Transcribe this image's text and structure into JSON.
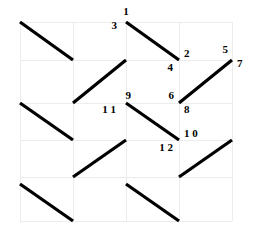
{
  "figure": {
    "title": "",
    "background_color": "#ffffff",
    "line_color": "#000000",
    "grid_color": "#ececec",
    "label_color": "#000000",
    "width": 254,
    "height": 237
  },
  "chart_data": {
    "type": "scatter",
    "title": "",
    "xlabel": "",
    "ylabel": "",
    "grid": true,
    "legend": "none",
    "xlim": [
      0,
      4
    ],
    "ylim": [
      0,
      5
    ],
    "grid_columns": 4,
    "grid_rows": 5,
    "grid_x_ticks": [
      20,
      73,
      126,
      179,
      232
    ],
    "grid_y_ticks": [
      22,
      60,
      103,
      140,
      177,
      221
    ],
    "segments": [
      {
        "id": "s1",
        "x1": 20,
        "y1": 22,
        "x2": 73,
        "y2": 60,
        "labels": []
      },
      {
        "id": "s2",
        "x1": 126,
        "y1": 22,
        "x2": 179,
        "y2": 60,
        "labels": [
          "1",
          "3",
          "2",
          "4"
        ]
      },
      {
        "id": "s3",
        "x1": 73,
        "y1": 103,
        "x2": 126,
        "y2": 60,
        "labels": []
      },
      {
        "id": "s4",
        "x1": 179,
        "y1": 103,
        "x2": 232,
        "y2": 60,
        "labels": [
          "5",
          "7",
          "6",
          "8"
        ]
      },
      {
        "id": "s5",
        "x1": 20,
        "y1": 103,
        "x2": 73,
        "y2": 140,
        "labels": []
      },
      {
        "id": "s6",
        "x1": 126,
        "y1": 103,
        "x2": 179,
        "y2": 140,
        "labels": [
          "9",
          "1 1",
          "1 0",
          "1 2"
        ]
      },
      {
        "id": "s7",
        "x1": 73,
        "y1": 177,
        "x2": 126,
        "y2": 140,
        "labels": []
      },
      {
        "id": "s8",
        "x1": 179,
        "y1": 177,
        "x2": 232,
        "y2": 140,
        "labels": []
      },
      {
        "id": "s9",
        "x1": 20,
        "y1": 184,
        "x2": 73,
        "y2": 221,
        "labels": []
      },
      {
        "id": "s10",
        "x1": 126,
        "y1": 184,
        "x2": 179,
        "y2": 221,
        "labels": []
      }
    ],
    "point_labels": [
      {
        "text": "1",
        "x": 126,
        "y": 6,
        "anchor": "middle"
      },
      {
        "text": "3",
        "x": 117,
        "y": 20,
        "anchor": "end"
      },
      {
        "text": "2",
        "x": 184,
        "y": 48,
        "anchor": "start"
      },
      {
        "text": "4",
        "x": 173,
        "y": 62,
        "anchor": "end"
      },
      {
        "text": "5",
        "x": 228,
        "y": 44,
        "anchor": "end"
      },
      {
        "text": "7",
        "x": 237,
        "y": 58,
        "anchor": "start"
      },
      {
        "text": "6",
        "x": 174,
        "y": 90,
        "anchor": "end"
      },
      {
        "text": "8",
        "x": 184,
        "y": 104,
        "anchor": "start"
      },
      {
        "text": "9",
        "x": 131,
        "y": 90,
        "anchor": "end"
      },
      {
        "text": "1 1",
        "x": 116,
        "y": 104,
        "anchor": "end"
      },
      {
        "text": "1 0",
        "x": 184,
        "y": 128,
        "anchor": "start"
      },
      {
        "text": "1 2",
        "x": 173,
        "y": 142,
        "anchor": "end"
      }
    ]
  }
}
